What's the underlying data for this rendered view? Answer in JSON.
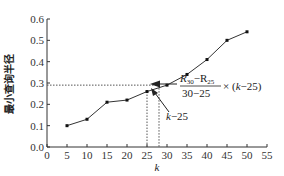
{
  "chart_data": {
    "type": "line",
    "title": "",
    "xlabel": "k",
    "ylabel": "最小查询半径",
    "x": [
      5,
      10,
      15,
      20,
      25,
      30,
      35,
      40,
      45,
      50
    ],
    "series": [
      {
        "name": "最小查询半径",
        "values": [
          0.1,
          0.13,
          0.21,
          0.22,
          0.26,
          0.29,
          0.34,
          0.41,
          0.5,
          0.54
        ]
      }
    ],
    "xlim": [
      0,
      55
    ],
    "ylim": [
      0.0,
      0.6
    ],
    "xticks": [
      "0",
      "5",
      "10",
      "15",
      "20",
      "25",
      "30",
      "35",
      "40",
      "45",
      "50",
      "55"
    ],
    "yticks": [
      "0.0",
      "0.1",
      "0.2",
      "0.3",
      "0.4",
      "0.5",
      "0.6"
    ],
    "grid": false,
    "legend": "none",
    "annotations": {
      "interpolation_point": {
        "k": 28,
        "value": 0.29
      },
      "reference_lines": [
        "horizontal dashed at 0.29",
        "vertical dashed at k=25",
        "vertical dashed at k=28"
      ],
      "slope_formula_numerator": "R30−R25",
      "slope_formula_denominator": "30−25",
      "slope_formula_suffix": "× (k−25)",
      "offset_label": "k−25"
    }
  },
  "labels": {
    "ylabel": "最小查询半径",
    "xlabel": "k",
    "formula_num_R": "R",
    "formula_num_sub1": "30",
    "formula_num_mid": "−R",
    "formula_num_sub2": "25",
    "formula_den": "30−25",
    "formula_times": "× (",
    "formula_k": "k",
    "formula_tail": "−25)",
    "offset_k": "k",
    "offset_tail": "−25"
  }
}
